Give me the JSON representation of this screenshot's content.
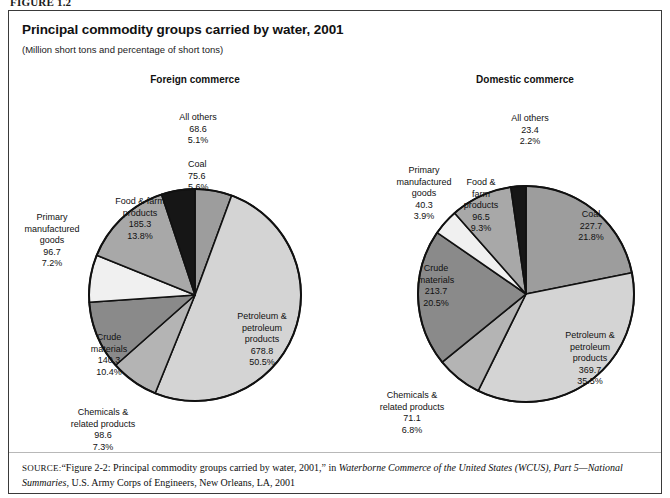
{
  "figure": {
    "label": "FIGURE 1.2",
    "title": "Principal commodity groups carried by water, 2001",
    "subtitle": "(Million short tons and percentage of short tons)"
  },
  "panels": {
    "foreign_heading": "Foreign commerce",
    "domestic_heading": "Domestic commerce"
  },
  "source": {
    "tag": "SOURCE:",
    "text_1": "“Figure 2-2: Principal commodity groups carried by water, 2001,” in ",
    "italic_1": "Waterborne Commerce of the United States (WCUS), Part 5—National Summaries,",
    "text_2": " U.S. Army Corps of Engineers, New Orleans, LA, 2001"
  },
  "colors": {
    "coal": "#9d9d9d",
    "petroleum": "#d4d4d4",
    "chemicals": "#b4b4b4",
    "crude": "#8a8a8a",
    "primary": "#f0f0f0",
    "food": "#a8a8a8",
    "all_others": "#161616",
    "outline": "#111111",
    "frame": "#3a3a3a"
  },
  "chart_data": [
    {
      "type": "pie",
      "title": "Foreign commerce",
      "subtitle": "(Million short tons and percentage of short tons)",
      "unit": "million short tons",
      "total": 1343.9,
      "legend": "none",
      "start_angle_deg": 0,
      "direction": "clockwise",
      "categories": [
        "Coal",
        "Petroleum & petroleum products",
        "Chemicals & related products",
        "Crude materials",
        "Primary manufactured goods",
        "Food & farm products",
        "All others"
      ],
      "values": [
        75.6,
        678.8,
        98.6,
        140.3,
        96.7,
        185.3,
        68.6
      ],
      "percents": [
        5.6,
        50.5,
        7.3,
        10.4,
        7.2,
        13.8,
        5.1
      ],
      "slices": [
        {
          "name": "Coal",
          "name_lines": [
            "Coal"
          ],
          "value": "75.6",
          "percent": "5.6%",
          "color": "#9d9d9d"
        },
        {
          "name": "Petroleum & petroleum products",
          "name_lines": [
            "Petroleum &",
            "petroleum",
            "products"
          ],
          "value": "678.8",
          "percent": "50.5%",
          "color": "#d4d4d4"
        },
        {
          "name": "Chemicals & related products",
          "name_lines": [
            "Chemicals &",
            "related products"
          ],
          "value": "98.6",
          "percent": "7.3%",
          "color": "#b4b4b4"
        },
        {
          "name": "Crude materials",
          "name_lines": [
            "Crude",
            "materials"
          ],
          "value": "140.3",
          "percent": "10.4%",
          "color": "#8a8a8a"
        },
        {
          "name": "Primary manufactured goods",
          "name_lines": [
            "Primary",
            "manufactured",
            "goods"
          ],
          "value": "96.7",
          "percent": "7.2%",
          "color": "#f0f0f0"
        },
        {
          "name": "Food & farm products",
          "name_lines": [
            "Food & farm",
            "products"
          ],
          "value": "185.3",
          "percent": "13.8%",
          "color": "#a8a8a8"
        },
        {
          "name": "All others",
          "name_lines": [
            "All others"
          ],
          "value": "68.6",
          "percent": "5.1%",
          "color": "#161616"
        }
      ]
    },
    {
      "type": "pie",
      "title": "Domestic commerce",
      "subtitle": "(Million short tons and percentage of short tons)",
      "unit": "million short tons",
      "total": 1042.4,
      "legend": "none",
      "start_angle_deg": 0,
      "direction": "clockwise",
      "categories": [
        "Coal",
        "Petroleum & petroleum products",
        "Chemicals & related products",
        "Crude materials",
        "Primary manufactured goods",
        "Food & farm products",
        "All others"
      ],
      "values": [
        227.7,
        369.7,
        71.1,
        213.7,
        40.3,
        96.5,
        23.4
      ],
      "percents": [
        21.8,
        35.5,
        6.8,
        20.5,
        3.9,
        9.3,
        2.2
      ],
      "slices": [
        {
          "name": "Coal",
          "name_lines": [
            "Coal"
          ],
          "value": "227.7",
          "percent": "21.8%",
          "color": "#9d9d9d"
        },
        {
          "name": "Petroleum & petroleum products",
          "name_lines": [
            "Petroleum &",
            "petroleum",
            "products"
          ],
          "value": "369.7",
          "percent": "35.5%",
          "color": "#d4d4d4"
        },
        {
          "name": "Chemicals & related products",
          "name_lines": [
            "Chemicals &",
            "related products"
          ],
          "value": "71.1",
          "percent": "6.8%",
          "color": "#b4b4b4"
        },
        {
          "name": "Crude materials",
          "name_lines": [
            "Crude",
            "materials"
          ],
          "value": "213.7",
          "percent": "20.5%",
          "color": "#8a8a8a"
        },
        {
          "name": "Primary manufactured goods",
          "name_lines": [
            "Primary",
            "manufactured",
            "goods"
          ],
          "value": "40.3",
          "percent": "3.9%",
          "color": "#f0f0f0"
        },
        {
          "name": "Food & farm products",
          "name_lines": [
            "Food &",
            "farm",
            "products"
          ],
          "value": "96.5",
          "percent": "9.3%",
          "color": "#a8a8a8"
        },
        {
          "name": "All others",
          "name_lines": [
            "All others"
          ],
          "value": "23.4",
          "percent": "2.2%",
          "color": "#161616"
        }
      ]
    }
  ]
}
